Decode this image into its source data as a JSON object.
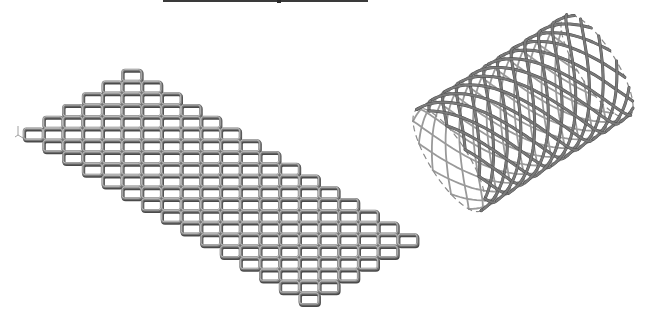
{
  "figure": {
    "caption_hidden": "Flat lattice mesh and rolled cylindrical lattice",
    "background": "#ffffff",
    "strut_color": "#7a7a7a",
    "strut_highlight": "#c8c8c8",
    "strut_shadow": "#4a4a4a",
    "top_rule": {
      "x1": 163,
      "x2": 368,
      "notch_x": 277
    },
    "flat_mesh": {
      "label": "flat-mesh",
      "origin_x": 24,
      "origin_y": 70,
      "col_pitch": 19.7,
      "row_pitch": 11.75,
      "cell_w": 20,
      "cell_h": 12,
      "cols": 20,
      "rows": 20,
      "diag_min": -5,
      "diag_max": 5,
      "sum_min": 5,
      "sum_max": 33
    },
    "cylinder": {
      "label": "rolled-mesh-cylinder",
      "axis_start": [
        449,
        160
      ],
      "axis_end": [
        597,
        66
      ],
      "radius": 60,
      "end_minor_ratio": 0.32,
      "helix_count": 12,
      "helix_turns": 0.9,
      "samples": 80
    },
    "axis_glyph": {
      "x": 16,
      "y": 126
    }
  }
}
